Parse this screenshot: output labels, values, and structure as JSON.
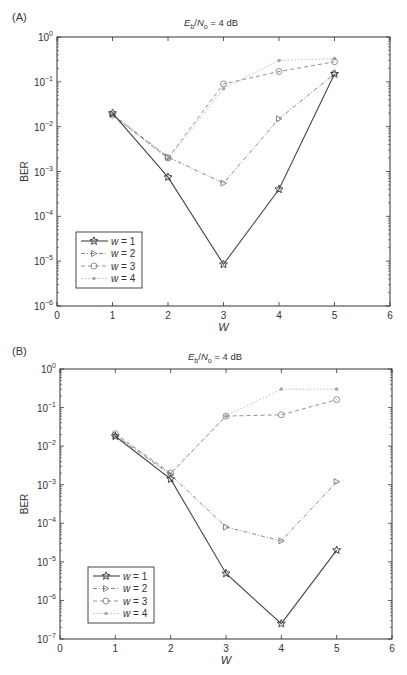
{
  "chart_data": [
    {
      "panel": "(A)",
      "type": "line",
      "title": "Eb/No = 4 dB",
      "title_parts": {
        "E": "E",
        "b": "b",
        "slash": "/",
        "N": "N",
        "o": "o",
        "rest": " = 4 dB"
      },
      "xlabel": "W",
      "ylabel": "BER",
      "yscale": "log",
      "xlim": [
        0,
        6
      ],
      "ylim": [
        1e-06,
        1
      ],
      "x_ticks": [
        "0",
        "1",
        "2",
        "3",
        "4",
        "5",
        "6"
      ],
      "y_ticks": [
        "10^0",
        "10^-1",
        "10^-2",
        "10^-3",
        "10^-4",
        "10^-5",
        "10^-6"
      ],
      "y_tick_exps": [
        0,
        -1,
        -2,
        -3,
        -4,
        -5,
        -6
      ],
      "legend_position": "lower left",
      "x": [
        1,
        2,
        3,
        4,
        5
      ],
      "series": [
        {
          "name": "w = 1",
          "marker": "star",
          "linestyle": "solid",
          "values": [
            0.02,
            0.00075,
            8.5e-06,
            0.0004,
            0.15
          ]
        },
        {
          "name": "w = 2",
          "marker": "triangle-right",
          "linestyle": "dashdot",
          "values": [
            0.019,
            0.0021,
            0.00055,
            0.015,
            0.15
          ]
        },
        {
          "name": "w = 3",
          "marker": "circle-open",
          "linestyle": "dashed",
          "values": [
            0.018,
            0.002,
            0.09,
            0.17,
            0.28
          ]
        },
        {
          "name": "w = 4",
          "marker": "dot",
          "linestyle": "dotted",
          "values": [
            0.018,
            0.0019,
            0.07,
            0.3,
            0.33
          ]
        }
      ]
    },
    {
      "panel": "(B)",
      "type": "line",
      "title": "Eb/No = 4 dB",
      "title_parts": {
        "E": "E",
        "b": "b",
        "slash": "/",
        "N": "N",
        "o": "o",
        "rest": " = 4 dB"
      },
      "xlabel": "W",
      "ylabel": "BER",
      "yscale": "log",
      "xlim": [
        0,
        6
      ],
      "ylim": [
        1e-07,
        1
      ],
      "x_ticks": [
        "0",
        "1",
        "2",
        "3",
        "4",
        "5",
        "6"
      ],
      "y_ticks": [
        "10^0",
        "10^-1",
        "10^-2",
        "10^-3",
        "10^-4",
        "10^-5",
        "10^-6",
        "10^-7"
      ],
      "y_tick_exps": [
        0,
        -1,
        -2,
        -3,
        -4,
        -5,
        -6,
        -7
      ],
      "legend_position": "lower left",
      "x": [
        1,
        2,
        3,
        4,
        5
      ],
      "series": [
        {
          "name": "w = 1",
          "marker": "star",
          "linestyle": "solid",
          "values": [
            0.018,
            0.0014,
            5e-06,
            2.5e-07,
            2e-05
          ]
        },
        {
          "name": "w = 2",
          "marker": "triangle-right",
          "linestyle": "dashed",
          "values": [
            0.019,
            0.0018,
            8e-05,
            3.5e-05,
            0.0012
          ]
        },
        {
          "name": "w = 3",
          "marker": "circle-open",
          "linestyle": "dashed",
          "values": [
            0.021,
            0.002,
            0.06,
            0.065,
            0.16
          ]
        },
        {
          "name": "w = 4",
          "marker": "dot",
          "linestyle": "dotted",
          "values": [
            0.02,
            0.0019,
            0.06,
            0.3,
            0.3
          ]
        }
      ]
    }
  ],
  "colors": {
    "axis": "#333333",
    "w1": "#444444",
    "w2": "#777777",
    "w3": "#888888",
    "w4": "#aaaaaa"
  }
}
